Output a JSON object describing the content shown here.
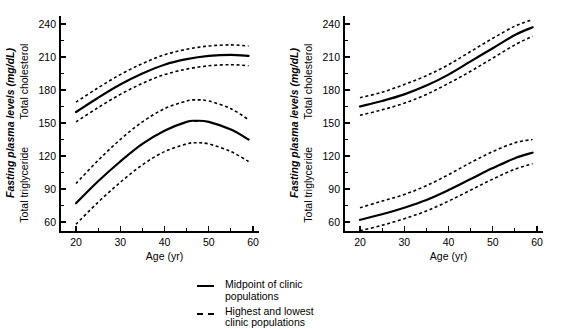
{
  "chart_data": [
    {
      "id": "left",
      "type": "line",
      "title": "",
      "xlabel": "Age (yr)",
      "ylabel_italic": "Fasting plasma levels (mg/dL)",
      "ylabel_upper": "Total cholesterol",
      "ylabel_lower": "Total triglyceride",
      "xlim": [
        18,
        60
      ],
      "ylim": [
        55,
        248
      ],
      "xticks": [
        20,
        30,
        40,
        50,
        60
      ],
      "yticks": [
        60,
        90,
        120,
        150,
        180,
        210,
        240
      ],
      "yticks_minor": [
        75,
        105,
        135,
        165,
        195,
        225
      ],
      "grid": false,
      "series": [
        {
          "name": "Total cholesterol - midpoint of clinic populations",
          "style": "solid",
          "x": [
            20,
            25,
            30,
            35,
            40,
            45,
            50,
            55,
            59
          ],
          "values": [
            160,
            173,
            185,
            195,
            203,
            208,
            211,
            212,
            211
          ]
        },
        {
          "name": "Total cholesterol - highest clinic populations",
          "style": "dashed",
          "x": [
            20,
            25,
            30,
            35,
            40,
            45,
            50,
            55,
            59
          ],
          "values": [
            169,
            182,
            194,
            204,
            212,
            217,
            220,
            221,
            220
          ]
        },
        {
          "name": "Total cholesterol - lowest clinic populations",
          "style": "dashed",
          "x": [
            20,
            25,
            30,
            35,
            40,
            45,
            50,
            55,
            59
          ],
          "values": [
            151,
            164,
            176,
            186,
            194,
            199,
            202,
            203,
            202
          ]
        },
        {
          "name": "Total triglyceride - midpoint of clinic populations",
          "style": "solid",
          "x": [
            20,
            25,
            30,
            35,
            40,
            45,
            47,
            50,
            55,
            59
          ],
          "values": [
            77,
            97,
            115,
            131,
            143,
            151,
            152,
            151,
            144,
            135
          ]
        },
        {
          "name": "Total triglyceride - highest clinic populations",
          "style": "dashed",
          "x": [
            20,
            25,
            30,
            35,
            40,
            45,
            47,
            50,
            55,
            59
          ],
          "values": [
            95,
            116,
            135,
            151,
            163,
            170,
            171,
            170,
            163,
            153
          ]
        },
        {
          "name": "Total triglyceride - lowest clinic populations",
          "style": "dashed",
          "x": [
            20,
            25,
            30,
            35,
            40,
            45,
            47,
            50,
            55,
            59
          ],
          "values": [
            58,
            78,
            96,
            112,
            124,
            131,
            132,
            131,
            124,
            115
          ]
        }
      ]
    },
    {
      "id": "right",
      "type": "line",
      "title": "",
      "xlabel": "Age (yr)",
      "ylabel_italic": "Fasting plasma levels (mg/dL)",
      "ylabel_upper": "Total cholesterol",
      "ylabel_lower": "Total triglyceride",
      "xlim": [
        18,
        60
      ],
      "ylim": [
        55,
        248
      ],
      "xticks": [
        20,
        30,
        40,
        50,
        60
      ],
      "yticks": [
        60,
        90,
        120,
        150,
        180,
        210,
        240
      ],
      "yticks_minor": [
        75,
        105,
        135,
        165,
        195,
        225
      ],
      "grid": false,
      "series": [
        {
          "name": "Total cholesterol - midpoint of clinic populations",
          "style": "solid",
          "x": [
            20,
            25,
            30,
            35,
            40,
            45,
            50,
            55,
            59
          ],
          "values": [
            165,
            170,
            176,
            184,
            194,
            206,
            218,
            230,
            237
          ]
        },
        {
          "name": "Total cholesterol - highest clinic populations",
          "style": "dashed",
          "x": [
            20,
            25,
            30,
            35,
            40,
            45,
            50,
            55,
            59
          ],
          "values": [
            173,
            178,
            185,
            193,
            203,
            215,
            227,
            238,
            244
          ]
        },
        {
          "name": "Total cholesterol - lowest clinic populations",
          "style": "dashed",
          "x": [
            20,
            25,
            30,
            35,
            40,
            45,
            50,
            55,
            59
          ],
          "values": [
            157,
            162,
            168,
            176,
            186,
            197,
            209,
            221,
            229
          ]
        },
        {
          "name": "Total triglyceride - midpoint of clinic populations",
          "style": "solid",
          "x": [
            20,
            25,
            30,
            35,
            40,
            45,
            50,
            55,
            59
          ],
          "values": [
            62,
            67,
            73,
            80,
            89,
            99,
            109,
            118,
            123
          ]
        },
        {
          "name": "Total triglyceride - highest clinic populations",
          "style": "dashed",
          "x": [
            20,
            25,
            30,
            35,
            40,
            45,
            50,
            55,
            59
          ],
          "values": [
            73,
            79,
            85,
            93,
            103,
            114,
            124,
            132,
            135
          ]
        },
        {
          "name": "Total triglyceride - lowest clinic populations",
          "style": "dashed",
          "x": [
            20,
            25,
            30,
            35,
            40,
            45,
            50,
            55,
            59
          ],
          "values": [
            52,
            57,
            63,
            70,
            79,
            89,
            99,
            108,
            113
          ]
        }
      ]
    }
  ],
  "legend": {
    "items": [
      {
        "style": "solid",
        "label": "Midpoint of clinic\npopulations"
      },
      {
        "style": "dashed",
        "label": "Highest and lowest\nclinic populations"
      }
    ]
  },
  "colors": {
    "ink": "#000000",
    "background": "#ffffff"
  }
}
